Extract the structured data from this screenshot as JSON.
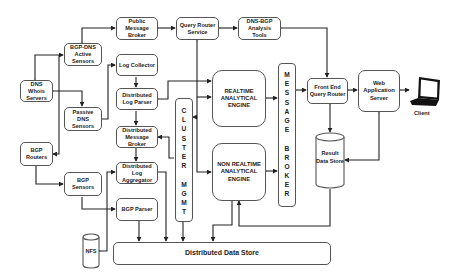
{
  "diagram": {
    "nodes": {
      "public_message_broker": "Public Message Broker",
      "query_router_service": "Query Router Service",
      "dns_bgp_analysis_tools": "DNS-BGP Analysis Tools",
      "bgp_dns_active_sensors": "BGP-DNS Active Sensors",
      "log_collector": "Log Collector",
      "dns_whois_servers": "DNS Whois Servers",
      "distributed_log_parser": "Distributed Log Parser",
      "passive_dns_sensors": "Passive DNS Sensors",
      "realtime_engine": "REALTIME ANALYTICAL ENGINE",
      "non_realtime_engine": "NON REALTIME ANALYTICAL ENGINE",
      "distributed_message_broker": "Distributed Message Broker",
      "bgp_routers": "BGP Routers",
      "distributed_log_aggregator": "Distributed Log Aggregator",
      "bgp_sensors": "BGP Sensors",
      "bgp_parser": "BGP Parser",
      "nfs": "NFS",
      "distributed_data_store": "Distributed Data Store",
      "front_end_query_router": "Front End Query Router",
      "web_application_server": "Web Application Server",
      "result_data_store": "Result Data Store",
      "client": "Client"
    },
    "cluster_mgmt_letters": [
      "C",
      "L",
      "U",
      "S",
      "T",
      "E",
      "R",
      "",
      "M",
      "G",
      "M",
      "T"
    ],
    "message_broker_letters": [
      "M",
      "E",
      "S",
      "S",
      "A",
      "G",
      "E",
      "",
      "B",
      "R",
      "O",
      "K",
      "E",
      "R"
    ],
    "colors": {
      "line": "#222222",
      "box_border": "#555555",
      "text": "#222222",
      "background": "#ffffff"
    }
  }
}
